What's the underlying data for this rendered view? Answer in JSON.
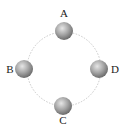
{
  "diagram": {
    "type": "circular-path-with-positions",
    "path": {
      "style": "dotted",
      "color": "#c8c8c8",
      "cx": 64,
      "cy": 69,
      "r": 37
    },
    "ball_colors": {
      "highlight": "#e6e6e6",
      "mid": "#a6a6a6",
      "shadow": "#6c6c6c"
    },
    "positions": [
      {
        "id": "A",
        "label": "A",
        "cx": 64,
        "cy": 31,
        "lx": 64,
        "ly": 17
      },
      {
        "id": "B",
        "label": "B",
        "cx": 24,
        "cy": 69,
        "lx": 10,
        "ly": 73
      },
      {
        "id": "C",
        "label": "C",
        "cx": 63,
        "cy": 106,
        "lx": 63,
        "ly": 124
      },
      {
        "id": "D",
        "label": "D",
        "cx": 99,
        "cy": 69,
        "lx": 115,
        "ly": 73
      }
    ]
  }
}
